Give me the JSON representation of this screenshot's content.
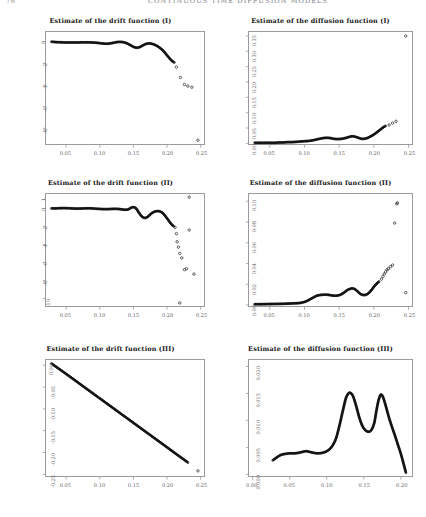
{
  "header": {
    "folio": "76",
    "running_title": "CONTINUOUS TIME DIFFUSION MODELS"
  },
  "figure": {
    "panels": [
      {
        "id": "drift-1",
        "title": "Estimate of the drift function (I)",
        "xlabel": "",
        "ylabel": ""
      },
      {
        "id": "diffusion-1",
        "title": "Estimate of the diffusion function (I)",
        "xlabel": "",
        "ylabel": ""
      },
      {
        "id": "drift-2",
        "title": "Estimate of the drift function (II)",
        "xlabel": "",
        "ylabel": ""
      },
      {
        "id": "diffusion-2",
        "title": "Estimate of the diffusion function (II)",
        "xlabel": "",
        "ylabel": ""
      },
      {
        "id": "drift-3",
        "title": "Estimate of the drift function (III)",
        "xlabel": "",
        "ylabel": ""
      },
      {
        "id": "diffusion-3",
        "title": "Estimate of the diffusion function (III)",
        "xlabel": "",
        "ylabel": ""
      }
    ]
  },
  "chart_data": [
    {
      "type": "scatter",
      "id": "drift-1",
      "title": "Estimate of the drift function (I)",
      "xlabel": "",
      "ylabel": "",
      "xlim": [
        0.02,
        0.255
      ],
      "ylim": [
        -9.5,
        0.9
      ],
      "xticks": [
        0.05,
        0.1,
        0.15,
        0.2,
        0.25
      ],
      "xticklabels": [
        "0.05",
        "0.10",
        "0.15",
        "0.20",
        "0.25"
      ],
      "yticks": [
        0,
        -2,
        -4,
        -6,
        -8
      ],
      "yticklabels": [
        "0",
        "-2",
        "-4",
        "-6",
        "-8"
      ],
      "grid": false,
      "legend": null,
      "series": [
        {
          "name": "dense-curve",
          "marker": "open-circle-dense",
          "x": [
            0.028,
            0.032,
            0.036,
            0.04,
            0.044,
            0.048,
            0.052,
            0.056,
            0.06,
            0.064,
            0.068,
            0.072,
            0.076,
            0.08,
            0.084,
            0.088,
            0.092,
            0.096,
            0.1,
            0.104,
            0.108,
            0.112,
            0.116,
            0.12,
            0.124,
            0.128,
            0.132,
            0.136,
            0.14,
            0.144,
            0.148,
            0.152,
            0.156,
            0.16,
            0.164,
            0.168,
            0.172,
            0.176,
            0.18,
            0.184,
            0.188,
            0.192,
            0.196,
            0.2,
            0.204,
            0.208,
            0.212
          ],
          "y": [
            0.0,
            -0.02,
            -0.04,
            -0.05,
            -0.06,
            -0.07,
            -0.07,
            -0.07,
            -0.07,
            -0.07,
            -0.07,
            -0.06,
            -0.06,
            -0.06,
            -0.06,
            -0.07,
            -0.08,
            -0.1,
            -0.13,
            -0.16,
            -0.18,
            -0.18,
            -0.15,
            -0.1,
            -0.05,
            -0.02,
            -0.02,
            -0.06,
            -0.14,
            -0.26,
            -0.4,
            -0.52,
            -0.55,
            -0.48,
            -0.34,
            -0.22,
            -0.16,
            -0.17,
            -0.24,
            -0.35,
            -0.5,
            -0.7,
            -0.95,
            -1.25,
            -1.55,
            -1.8,
            -1.95
          ]
        },
        {
          "name": "sparse-outliers",
          "marker": "open-circle",
          "x": [
            0.214,
            0.22,
            0.226,
            0.231,
            0.237,
            0.246
          ],
          "y": [
            -2.35,
            -3.3,
            -3.95,
            -4.1,
            -4.2,
            -9.1
          ]
        }
      ]
    },
    {
      "type": "scatter",
      "id": "diffusion-1",
      "title": "Estimate of the diffusion function (I)",
      "xlabel": "",
      "ylabel": "",
      "xlim": [
        0.02,
        0.255
      ],
      "ylim": [
        -0.004,
        0.363
      ],
      "xticks": [
        0.05,
        0.1,
        0.15,
        0.2,
        0.25
      ],
      "xticklabels": [
        "0.05",
        "0.10",
        "0.15",
        "0.20",
        "0.25"
      ],
      "yticks": [
        0.0,
        0.05,
        0.1,
        0.15,
        0.2,
        0.25,
        0.3,
        0.35
      ],
      "yticklabels": [
        "0.00",
        "0.05",
        "0.10",
        "0.15",
        "0.20",
        "0.25",
        "0.30",
        "0.35"
      ],
      "grid": false,
      "legend": null,
      "series": [
        {
          "name": "dense-curve",
          "marker": "open-circle-dense",
          "x": [
            0.028,
            0.034,
            0.04,
            0.046,
            0.052,
            0.058,
            0.064,
            0.07,
            0.076,
            0.082,
            0.088,
            0.094,
            0.1,
            0.106,
            0.112,
            0.118,
            0.124,
            0.13,
            0.134,
            0.138,
            0.142,
            0.148,
            0.154,
            0.16,
            0.166,
            0.17,
            0.174,
            0.178,
            0.182,
            0.186,
            0.19,
            0.194,
            0.198,
            0.202,
            0.206,
            0.21,
            0.214,
            0.218
          ],
          "y": [
            0.002,
            0.002,
            0.002,
            0.002,
            0.002,
            0.002,
            0.003,
            0.003,
            0.004,
            0.004,
            0.005,
            0.006,
            0.007,
            0.008,
            0.01,
            0.013,
            0.016,
            0.018,
            0.018,
            0.017,
            0.015,
            0.014,
            0.015,
            0.018,
            0.022,
            0.023,
            0.021,
            0.018,
            0.015,
            0.015,
            0.017,
            0.021,
            0.026,
            0.032,
            0.039,
            0.046,
            0.053,
            0.058
          ]
        },
        {
          "name": "sparse-outliers",
          "marker": "open-circle",
          "x": [
            0.222,
            0.227,
            0.232,
            0.246
          ],
          "y": [
            0.06,
            0.066,
            0.072,
            0.35
          ]
        }
      ]
    },
    {
      "type": "scatter",
      "id": "drift-2",
      "title": "Estimate of the drift function (II)",
      "xlabel": "",
      "ylabel": "",
      "xlim": [
        0.02,
        0.255
      ],
      "ylim": [
        -10.9,
        1.6
      ],
      "xticks": [
        0.05,
        0.1,
        0.15,
        0.2,
        0.25
      ],
      "xticklabels": [
        "0.05",
        "0.10",
        "0.15",
        "0.20",
        "0.25"
      ],
      "yticks": [
        1,
        0,
        -2,
        -4,
        -6,
        -8,
        -10
      ],
      "yticklabels": [
        "1",
        "0",
        "-2",
        "-4",
        "-6",
        "-8",
        "-10"
      ],
      "grid": false,
      "legend": null,
      "series": [
        {
          "name": "dense-curve",
          "marker": "open-circle-dense",
          "x": [
            0.028,
            0.034,
            0.04,
            0.046,
            0.052,
            0.058,
            0.064,
            0.07,
            0.076,
            0.082,
            0.088,
            0.094,
            0.1,
            0.106,
            0.112,
            0.118,
            0.124,
            0.13,
            0.136,
            0.142,
            0.146,
            0.15,
            0.154,
            0.158,
            0.162,
            0.166,
            0.17,
            0.174,
            0.178,
            0.182,
            0.186,
            0.19,
            0.194,
            0.198,
            0.202,
            0.206,
            0.21
          ],
          "y": [
            0.0,
            0.0,
            0.02,
            0.03,
            0.02,
            0.0,
            -0.02,
            -0.02,
            0.0,
            0.01,
            0.0,
            -0.03,
            -0.06,
            -0.08,
            -0.08,
            -0.06,
            -0.05,
            -0.08,
            -0.14,
            -0.12,
            0.05,
            0.14,
            0.0,
            -0.45,
            -0.85,
            -1.05,
            -1.0,
            -0.75,
            -0.5,
            -0.35,
            -0.3,
            -0.35,
            -0.55,
            -0.9,
            -1.3,
            -1.7,
            -2.0
          ]
        },
        {
          "name": "sparse-outliers",
          "marker": "open-circle",
          "x": [
            0.212,
            0.214,
            0.215,
            0.217,
            0.219,
            0.222,
            0.226,
            0.229,
            0.233,
            0.24,
            0.219
          ],
          "y": [
            -2.1,
            -2.8,
            -3.7,
            -4.3,
            -5.0,
            -5.5,
            -6.8,
            -6.7,
            -2.4,
            -7.3,
            -10.5
          ]
        },
        {
          "name": "top-outlier",
          "marker": "open-circle",
          "x": [
            0.233
          ],
          "y": [
            1.25
          ]
        }
      ]
    },
    {
      "type": "scatter",
      "id": "diffusion-2",
      "title": "Estimate of the diffusion function (II)",
      "xlabel": "",
      "ylabel": "",
      "xlim": [
        0.02,
        0.255
      ],
      "ylim": [
        -0.0015,
        0.107
      ],
      "xticks": [
        0.05,
        0.1,
        0.15,
        0.2,
        0.25
      ],
      "xticklabels": [
        "0.05",
        "0.10",
        "0.15",
        "0.20",
        "0.25"
      ],
      "yticks": [
        0.0,
        0.02,
        0.04,
        0.06,
        0.08,
        0.1
      ],
      "yticklabels": [
        "0.00",
        "0.02",
        "0.04",
        "0.06",
        "0.08",
        "0.10"
      ],
      "grid": false,
      "legend": null,
      "series": [
        {
          "name": "dense-curve",
          "marker": "open-circle-dense",
          "x": [
            0.028,
            0.036,
            0.044,
            0.052,
            0.06,
            0.068,
            0.076,
            0.084,
            0.092,
            0.1,
            0.106,
            0.112,
            0.118,
            0.124,
            0.13,
            0.134,
            0.138,
            0.144,
            0.15,
            0.156,
            0.162,
            0.168,
            0.172,
            0.176,
            0.18,
            0.184,
            0.188,
            0.192,
            0.196,
            0.2,
            0.204,
            0.208
          ],
          "y": [
            0.0008,
            0.0008,
            0.0009,
            0.001,
            0.0011,
            0.0012,
            0.0014,
            0.0016,
            0.0019,
            0.003,
            0.0048,
            0.007,
            0.009,
            0.0098,
            0.01,
            0.0099,
            0.0094,
            0.009,
            0.0095,
            0.0115,
            0.0145,
            0.016,
            0.0155,
            0.0135,
            0.011,
            0.0098,
            0.0098,
            0.0112,
            0.014,
            0.0175,
            0.0205,
            0.023
          ]
        },
        {
          "name": "sparse-outliers",
          "marker": "open-circle",
          "x": [
            0.211,
            0.213,
            0.215,
            0.217,
            0.219,
            0.221,
            0.224,
            0.227,
            0.23,
            0.233,
            0.234,
            0.246
          ],
          "y": [
            0.025,
            0.0275,
            0.03,
            0.032,
            0.034,
            0.035,
            0.037,
            0.0385,
            0.079,
            0.0975,
            0.0985,
            0.012
          ]
        }
      ]
    },
    {
      "type": "scatter",
      "id": "drift-3",
      "title": "Estimate of the drift function (III)",
      "xlabel": "",
      "ylabel": "",
      "xlim": [
        0.02,
        0.255
      ],
      "ylim": [
        -0.255,
        0.012
      ],
      "xticks": [
        0.05,
        0.1,
        0.15,
        0.2,
        0.25
      ],
      "xticklabels": [
        "0.05",
        "0.10",
        "0.15",
        "0.20",
        "0.25"
      ],
      "yticks": [
        0.0,
        -0.05,
        -0.1,
        -0.15,
        -0.2,
        -0.25
      ],
      "yticklabels": [
        "0.00",
        "-0.05",
        "-0.10",
        "-0.15",
        "-0.20",
        "-0.25"
      ],
      "grid": false,
      "legend": null,
      "series": [
        {
          "name": "linear-dense",
          "marker": "open-circle-dense",
          "x": [
            0.028,
            0.05,
            0.075,
            0.1,
            0.125,
            0.15,
            0.175,
            0.2,
            0.215,
            0.225,
            0.232
          ],
          "y": [
            0.004,
            -0.02,
            -0.048,
            -0.076,
            -0.104,
            -0.132,
            -0.16,
            -0.188,
            -0.205,
            -0.216,
            -0.224
          ]
        },
        {
          "name": "sparse-outliers",
          "marker": "open-circle",
          "x": [
            0.246
          ],
          "y": [
            -0.242
          ]
        }
      ]
    },
    {
      "type": "scatter",
      "id": "diffusion-3",
      "title": "Estimate of the diffusion function (III)",
      "xlabel": "",
      "ylabel": "",
      "xlim": [
        -0.005,
        0.215
      ],
      "ylim": [
        -0.0004,
        0.0212
      ],
      "xticks": [
        0.0,
        0.05,
        0.1,
        0.15,
        0.2
      ],
      "xticklabels": [
        "0.00",
        "0.05",
        "0.10",
        "0.15",
        "0.20"
      ],
      "yticks": [
        0.0,
        0.005,
        0.01,
        0.015,
        0.02
      ],
      "yticklabels": [
        "0.000",
        "0.005",
        "0.010",
        "0.015",
        "0.020"
      ],
      "grid": false,
      "legend": null,
      "series": [
        {
          "name": "dense-curve",
          "marker": "open-circle-dense",
          "x": [
            0.027,
            0.032,
            0.038,
            0.044,
            0.05,
            0.056,
            0.062,
            0.068,
            0.072,
            0.076,
            0.082,
            0.088,
            0.094,
            0.1,
            0.106,
            0.112,
            0.117,
            0.122,
            0.126,
            0.13,
            0.133,
            0.136,
            0.14,
            0.144,
            0.148,
            0.152,
            0.156,
            0.16,
            0.164,
            0.167,
            0.17,
            0.173,
            0.176,
            0.18,
            0.184,
            0.188,
            0.192,
            0.196,
            0.2,
            0.204,
            0.207
          ],
          "y": [
            0.0026,
            0.0031,
            0.0036,
            0.0038,
            0.0039,
            0.0039,
            0.004,
            0.0042,
            0.0043,
            0.0042,
            0.004,
            0.0039,
            0.004,
            0.0043,
            0.005,
            0.0065,
            0.009,
            0.012,
            0.0142,
            0.0151,
            0.015,
            0.0143,
            0.0125,
            0.0105,
            0.009,
            0.0082,
            0.0079,
            0.0082,
            0.0095,
            0.0118,
            0.0138,
            0.0148,
            0.0143,
            0.0125,
            0.0105,
            0.0088,
            0.0072,
            0.0055,
            0.0038,
            0.0018,
            0.0002
          ]
        }
      ]
    }
  ]
}
